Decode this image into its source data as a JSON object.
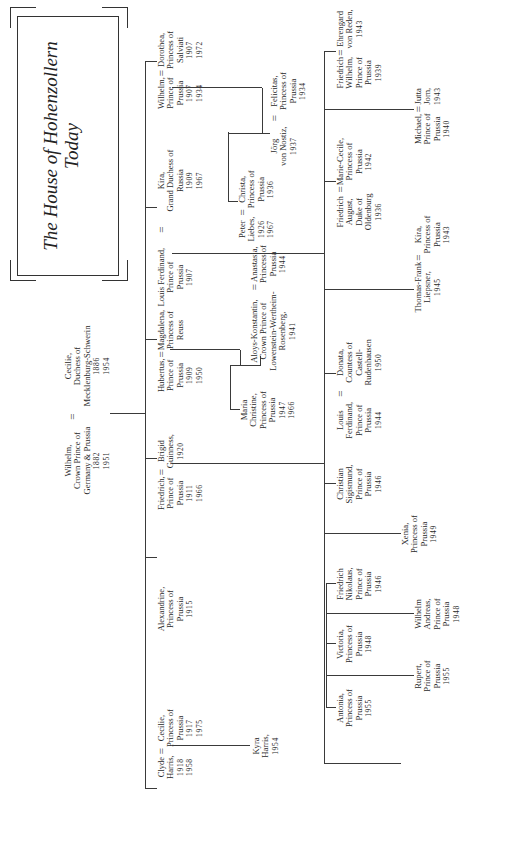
{
  "title": {
    "line1": "The House of Hohenzollern",
    "line2": "Today"
  },
  "generation1": {
    "husband": {
      "name": "Wilhelm,",
      "title1": "Crown Prince of",
      "title2": "Germany & Prussia",
      "born": "1882",
      "died": "1951"
    },
    "marriage": "=",
    "wife": {
      "name": "Cecilie,",
      "title1": "Duchess of",
      "title2": "Mecklenburg-Schwerin",
      "born": "1886",
      "died": "1954"
    }
  },
  "generation2": [
    {
      "id": "wilhelm",
      "name": "Wilhelm,",
      "title1": "Prince of",
      "title2": "Prussia",
      "born": "1907",
      "died": "1934",
      "spouse": {
        "name": "Dorothea,",
        "title1": "Princess of",
        "title2": "Salviati",
        "born": "1907",
        "died": "1972"
      }
    },
    {
      "id": "louis-ferdinand",
      "name": "Louis Ferdinand,",
      "title1": "Prince of",
      "title2": "Prussia",
      "born": "1907",
      "spouse": {
        "name": "Kira,",
        "title1": "Grand Duchess of",
        "title2": "Russia",
        "born": "1909",
        "died": "1967"
      }
    },
    {
      "id": "hubertus",
      "name": "Hubertus,",
      "title1": "Prince of",
      "title2": "Prussia",
      "born": "1909",
      "died": "1950",
      "spouse": {
        "name": "Magdalena,",
        "title1": "Princess of",
        "title2": "Reuss"
      }
    },
    {
      "id": "friedrich",
      "name": "Friedrich,",
      "title1": "Prince of",
      "title2": "Prussia",
      "born": "1911",
      "died": "1966",
      "spouse": {
        "name": "Brigid",
        "title1": "Guinness,",
        "born": "1920"
      }
    },
    {
      "id": "alexandrine",
      "name": "Alexandrine,",
      "title1": "Princess of",
      "title2": "Prussia",
      "born": "1915"
    },
    {
      "id": "cecilie",
      "name": "Cecilie,",
      "title1": "Princess of",
      "title2": "Prussia",
      "born": "1917",
      "died": "1975",
      "spouse": {
        "name": "Clyde",
        "title1": "Harris,",
        "born": "1918",
        "died": "1958"
      }
    }
  ],
  "generation3": {
    "wilhelm_children": [
      {
        "name": "Felicitas,",
        "title1": "Princess of",
        "title2": "Prussia",
        "born": "1934",
        "spouse": {
          "name": "Jörg",
          "title1": "von Nostiz,",
          "born": "1937"
        }
      },
      {
        "name": "Christa,",
        "title1": "Princess of",
        "title2": "Prussia",
        "born": "1936",
        "spouse": {
          "name": "Peter",
          "title1": "Liebes,",
          "born": "1926",
          "died": "1967"
        }
      }
    ],
    "louis_ferdinand_children": [
      {
        "name": "Friedrich",
        "title1": "Wilhelm,",
        "title2": "Prince of",
        "title3": "Prussia",
        "born": "1939",
        "spouse": {
          "name": "Ehrengard",
          "title1": "von Reden,",
          "born": "1943"
        }
      },
      {
        "name": "Michael,",
        "title1": "Prince of",
        "title2": "Prussia",
        "born": "1940",
        "spouse": {
          "name": "Jutta",
          "title1": "Jorn,",
          "born": "1943"
        }
      },
      {
        "name": "Marie-Cecile,",
        "title1": "Princess of",
        "title2": "Prussia",
        "born": "1942",
        "spouse": {
          "name": "Friedrich",
          "title1": "August,",
          "title2": "Duke of",
          "title3": "Oldenburg",
          "born": "1936"
        }
      },
      {
        "name": "Kira,",
        "title1": "Princess of",
        "title2": "Prussia",
        "born": "1943",
        "spouse": {
          "name": "Thomas-Frank",
          "title1": "Liepsner,",
          "born": "1945"
        }
      },
      {
        "name": "Louis",
        "title1": "Ferdinand,",
        "title2": "Prince of",
        "title3": "Prussia",
        "born": "1944",
        "spouse": {
          "name": "Donata,",
          "title1": "Countess of",
          "title2": "Castell-",
          "title3": "Rudenhausen",
          "born": "1950"
        }
      },
      {
        "name": "Christian",
        "title1": "Sigismund,",
        "title2": "Prince of",
        "title3": "Prussia",
        "born": "1946"
      },
      {
        "name": "Xenia,",
        "title1": "Princess of",
        "title2": "Prussia",
        "born": "1949"
      }
    ],
    "hubertus_children": [
      {
        "name": "Anastasia,",
        "title1": "Princess of",
        "title2": "Prussia",
        "born": "1944",
        "spouse": {
          "name": "Aloys-Konstantin,",
          "title1": "Crown Prince of",
          "title2": "Lowenstein-Wertheim-",
          "title3": "Rosenberg,",
          "born": "1941"
        }
      },
      {
        "name": "Maria",
        "title1": "Christine,",
        "title2": "Princess of",
        "title3": "Prussia",
        "born": "1947",
        "died": "1966"
      }
    ],
    "friedrich_children": [
      {
        "name": "Friedrich",
        "title1": "Nikolaus,",
        "title2": "Prince of",
        "title3": "Prussia",
        "born": "1946"
      },
      {
        "name": "Wilhelm",
        "title1": "Andreas,",
        "title2": "Prince of",
        "title3": "Prussia",
        "born": "1948"
      },
      {
        "name": "Victoria,",
        "title1": "Princess of",
        "title2": "Prussia",
        "born": "1948"
      },
      {
        "name": "Rupert,",
        "title1": "Prince of",
        "title2": "Prussia",
        "born": "1955"
      },
      {
        "name": "Antonia,",
        "title1": "Princess of",
        "title2": "Prussia",
        "born": "1955"
      }
    ],
    "cecilie_children": [
      {
        "name": "Kyra",
        "title1": "Harris,",
        "born": "1954"
      }
    ]
  },
  "symbols": {
    "marriage": "="
  }
}
